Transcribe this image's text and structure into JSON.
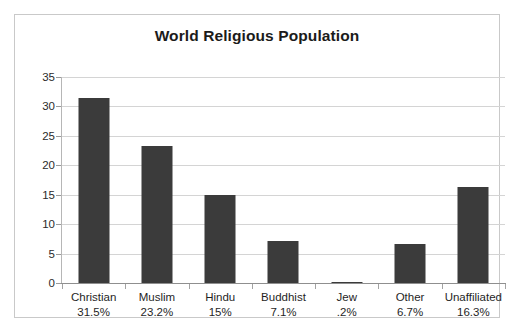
{
  "chart_data": {
    "type": "bar",
    "title": "World Religious Population",
    "xlabel": "",
    "ylabel": "",
    "categories": [
      "Christian",
      "Muslim",
      "Hindu",
      "Buddhist",
      "Jew",
      "Other",
      "Unaffiliated"
    ],
    "values": [
      31.5,
      23.2,
      15,
      7.1,
      0.2,
      6.7,
      16.3
    ],
    "point_labels": [
      "31.5%",
      "23.2%",
      "15%",
      "7.1%",
      ".2%",
      "6.7%",
      "16.3%"
    ],
    "ylim": [
      0,
      35
    ],
    "ytick_labels": [
      "0",
      "5",
      "10",
      "15",
      "20",
      "25",
      "30",
      "35"
    ],
    "ytick_values": [
      0,
      5,
      10,
      15,
      20,
      25,
      30,
      35
    ],
    "grid": true,
    "legend": false,
    "legend_position": "none",
    "series": [
      {
        "name": "World Religious Population",
        "values": [
          31.5,
          23.2,
          15,
          7.1,
          0.2,
          6.7,
          16.3
        ]
      }
    ],
    "colors": {
      "bar": "#3b3b3b",
      "gridline": "#d4d4d4",
      "axis": "#8f8f8f",
      "frame": "#c9c9c9",
      "text": "#1f1f1f",
      "background": "#ffffff"
    }
  }
}
